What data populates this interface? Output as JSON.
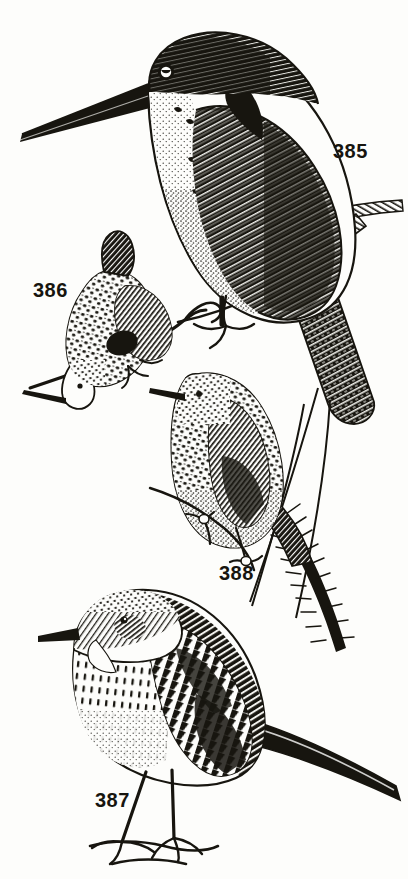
{
  "plate": {
    "kind": "engraved-natural-history-plate",
    "medium": "black-and-white wood engraving",
    "background_color": "#fdfdfb",
    "ink_color": "#17150f",
    "width": 408,
    "height": 879
  },
  "figures": [
    {
      "number": "385",
      "subject": "kingfisher perched on branch",
      "label_x": 333,
      "label_y": 140
    },
    {
      "number": "386",
      "subject": "small speckled bird clinging head-down to twig",
      "label_x": 33,
      "label_y": 279
    },
    {
      "number": "388",
      "subject": "spotted bird perched on reed stem",
      "label_x": 219,
      "label_y": 562
    },
    {
      "number": "387",
      "subject": "streaked pipit standing on ground",
      "label_x": 95,
      "label_y": 789
    }
  ]
}
